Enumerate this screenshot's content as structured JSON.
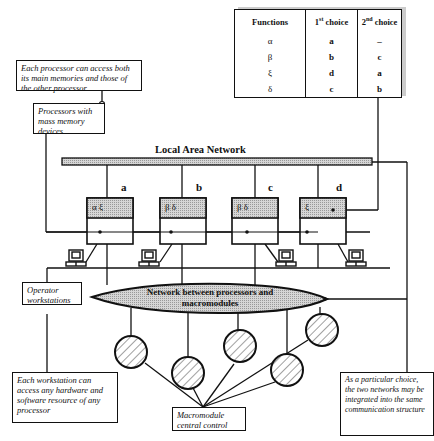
{
  "table": {
    "headers": [
      "Functions",
      "1st choice",
      "2nd choice"
    ],
    "header_parts": [
      {
        "main": "Functions"
      },
      {
        "num": "1",
        "sup": "st",
        "rest": " choice"
      },
      {
        "num": "2",
        "sup": "nd",
        "rest": " choice"
      }
    ],
    "rows": [
      {
        "function": "α",
        "first": "a",
        "second": "–"
      },
      {
        "function": "β",
        "first": "b",
        "second": "c"
      },
      {
        "function": "ξ",
        "first": "d",
        "second": "a"
      },
      {
        "function": "δ",
        "first": "c",
        "second": "b"
      }
    ]
  },
  "notes": {
    "processor_access": "Each processor can access both its main memories and those of the other processor",
    "mass_memory": "Processors with mass memory devices",
    "operator": "Operator workstations",
    "workstation_access": "Each workstation can access any hardware and software resource of any processor",
    "macromodule_control": "Macromodule central control",
    "integration": "As a particular choice, the two networks may be integrated into the same communication structure"
  },
  "lan": {
    "label": "Local Area Network"
  },
  "processors": [
    {
      "id": "a",
      "functions": "α ξ"
    },
    {
      "id": "b",
      "functions": "β δ"
    },
    {
      "id": "c",
      "functions": "β δ"
    },
    {
      "id": "d",
      "functions": "ξ"
    }
  ],
  "network": {
    "label_line1": "Network between processors and",
    "label_line2": "macromodules"
  },
  "colors": {
    "stroke": "#111111",
    "shade": "#bdbdbd",
    "ellipse_fill": "#c8c8c8"
  }
}
